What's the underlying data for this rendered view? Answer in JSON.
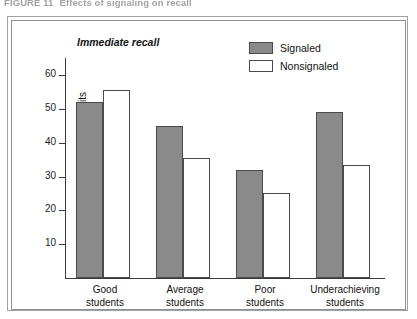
{
  "figure": {
    "caption_number": "FIGURE 11",
    "caption_text": "Effects of signaling on recall"
  },
  "chart_data": {
    "type": "bar",
    "title": "Immediate recall",
    "xlabel": "",
    "ylabel": "Mean number of recalled idea units",
    "categories": [
      "Good\nstudents",
      "Average\nstudents",
      "Poor\nstudents",
      "Underachieving\nstudents"
    ],
    "category_lines": [
      [
        "Good",
        "students"
      ],
      [
        "Average",
        "students"
      ],
      [
        "Poor",
        "students"
      ],
      [
        "Underachieving",
        "students"
      ]
    ],
    "series": [
      {
        "name": "Signaled",
        "color": "#8a8a8a",
        "values": [
          52,
          45,
          32,
          49
        ]
      },
      {
        "name": "Nonsignaled",
        "color": "#ffffff",
        "values": [
          55.5,
          35.5,
          25,
          33.5
        ]
      }
    ],
    "ylim": [
      0,
      65
    ],
    "yticks": [
      10,
      20,
      30,
      40,
      50,
      60
    ],
    "ytick_labels": [
      "10",
      "20",
      "30",
      "40",
      "50",
      "60"
    ],
    "grid": false,
    "legend_position": "top-right",
    "legend_entries": [
      {
        "label": "Signaled",
        "swatch": "filled"
      },
      {
        "label": "Nonsignaled",
        "swatch": "hollow"
      }
    ]
  }
}
